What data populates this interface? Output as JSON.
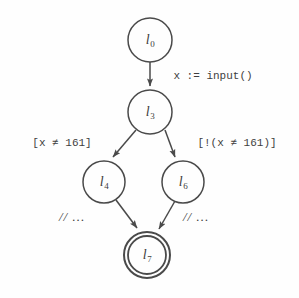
{
  "diagram": {
    "type": "control-flow-graph",
    "background_color": "#fefefe",
    "stroke_color": "#4a4a4a",
    "text_color": "#3f3f3f"
  },
  "nodes": [
    {
      "id": "l0",
      "label_base": "l",
      "label_sub": "0",
      "cx": 150,
      "cy": 40,
      "r": 22,
      "final": false
    },
    {
      "id": "l3",
      "label_base": "l",
      "label_sub": "3",
      "cx": 150,
      "cy": 112,
      "r": 22,
      "final": false
    },
    {
      "id": "l4",
      "label_base": "l",
      "label_sub": "4",
      "cx": 104,
      "cy": 182,
      "r": 21,
      "final": false
    },
    {
      "id": "l6",
      "label_base": "l",
      "label_sub": "6",
      "cx": 183,
      "cy": 182,
      "r": 21,
      "final": false
    },
    {
      "id": "l7",
      "label_base": "l",
      "label_sub": "7",
      "cx": 147,
      "cy": 255,
      "r": 23,
      "final": true
    }
  ],
  "edges": [
    {
      "id": "e-l0-l3",
      "from": "l0",
      "to": "l3",
      "label": "x := input()",
      "label_x": 213,
      "label_y": 76,
      "style": "mono"
    },
    {
      "id": "e-l3-l4",
      "from": "l3",
      "to": "l4",
      "label": "[x ≠ 161]",
      "label_x": 62,
      "label_y": 143,
      "style": "mono"
    },
    {
      "id": "e-l3-l6",
      "from": "l3",
      "to": "l6",
      "label": "[!(x ≠ 161)]",
      "label_x": 237,
      "label_y": 143,
      "style": "mono"
    },
    {
      "id": "e-l4-l7",
      "from": "l4",
      "to": "l7",
      "label": "// …",
      "label_x": 72,
      "label_y": 217,
      "style": "comment"
    },
    {
      "id": "e-l6-l7",
      "from": "l6",
      "to": "l7",
      "label": "// …",
      "label_x": 196,
      "label_y": 217,
      "style": "comment"
    }
  ]
}
